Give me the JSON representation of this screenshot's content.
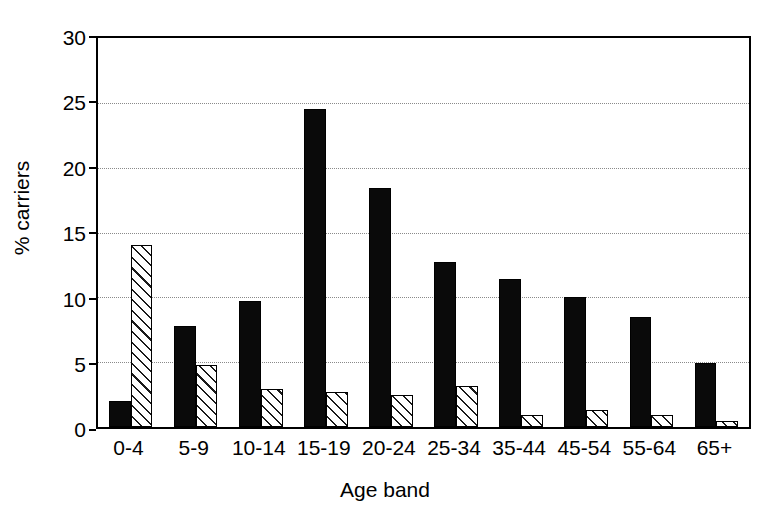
{
  "chart_data": {
    "type": "bar",
    "title": "",
    "subtitle": "",
    "xlabel": "Age band",
    "ylabel": "% carriers",
    "categories": [
      "0-4",
      "5-9",
      "10-14",
      "15-19",
      "20-24",
      "25-34",
      "35-44",
      "45-54",
      "55-64",
      "65+"
    ],
    "series": [
      {
        "name": "solid",
        "style": "solid-black",
        "color": "#000000",
        "values": [
          2.0,
          7.8,
          9.7,
          24.5,
          18.4,
          12.7,
          11.4,
          10.0,
          8.5,
          4.9
        ]
      },
      {
        "name": "hatched",
        "style": "diagonal-hatch",
        "color": "#ffffff",
        "values": [
          14.0,
          4.8,
          2.9,
          2.7,
          2.5,
          3.2,
          0.9,
          1.3,
          0.9,
          0.5
        ]
      }
    ],
    "ylim": [
      0,
      30
    ],
    "yticks": [
      0,
      5,
      10,
      15,
      20,
      25,
      30
    ],
    "ytick_labels": [
      "0",
      "5",
      "10",
      "15",
      "20",
      "25",
      "30"
    ],
    "grid": "horizontal-dotted",
    "legend": "none",
    "annotations": []
  },
  "axes": {
    "y_title": "% carriers",
    "x_title": "Age band",
    "y_labels": [
      "30",
      "25",
      "20",
      "15",
      "10",
      "5",
      "0"
    ],
    "x_labels": [
      "0-4",
      "5-9",
      "10-14",
      "15-19",
      "20-24",
      "25-34",
      "35-44",
      "45-54",
      "55-64",
      "65+"
    ]
  }
}
